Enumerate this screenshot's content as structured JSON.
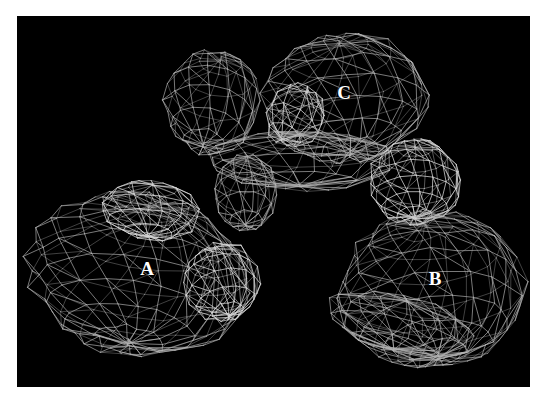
{
  "figure": {
    "panel": {
      "x": 17,
      "y": 16,
      "width": 513,
      "height": 371,
      "background": "#000000"
    },
    "mesh_color": "#b4b4b4",
    "mesh_highlight_color": "#d8d8d8",
    "labels": [
      {
        "id": "A",
        "text": "A",
        "x": 147,
        "y": 268
      },
      {
        "id": "B",
        "text": "B",
        "x": 435,
        "y": 278
      },
      {
        "id": "C",
        "text": "C",
        "x": 344,
        "y": 92
      }
    ],
    "lobes": [
      {
        "name": "lobe-c-left-bulb",
        "cx": 212,
        "cy": 102,
        "rx": 48,
        "ry": 52,
        "rings": 7,
        "segs": 14,
        "tilt": 0.2,
        "highlight": false
      },
      {
        "name": "lobe-c-main",
        "cx": 345,
        "cy": 98,
        "rx": 82,
        "ry": 64,
        "rings": 9,
        "segs": 18,
        "tilt": -0.1,
        "highlight": false
      },
      {
        "name": "lobe-c-inner-hex",
        "cx": 295,
        "cy": 115,
        "rx": 30,
        "ry": 32,
        "rings": 5,
        "segs": 10,
        "tilt": 0.5,
        "highlight": true
      },
      {
        "name": "lobe-c-lower-band",
        "cx": 300,
        "cy": 160,
        "rx": 95,
        "ry": 30,
        "rings": 5,
        "segs": 16,
        "tilt": 0.0,
        "highlight": false
      },
      {
        "name": "lobe-connector-mid",
        "cx": 246,
        "cy": 192,
        "rx": 32,
        "ry": 38,
        "rings": 6,
        "segs": 12,
        "tilt": 0.0,
        "highlight": false
      },
      {
        "name": "lobe-a-main",
        "cx": 138,
        "cy": 275,
        "rx": 110,
        "ry": 80,
        "rings": 10,
        "segs": 20,
        "tilt": 0.15,
        "highlight": false
      },
      {
        "name": "lobe-a-top",
        "cx": 150,
        "cy": 210,
        "rx": 50,
        "ry": 30,
        "rings": 6,
        "segs": 12,
        "tilt": 0.1,
        "highlight": true
      },
      {
        "name": "lobe-a-cap",
        "cx": 222,
        "cy": 282,
        "rx": 38,
        "ry": 40,
        "rings": 7,
        "segs": 14,
        "tilt": -0.2,
        "highlight": true
      },
      {
        "name": "lobe-b-top",
        "cx": 415,
        "cy": 182,
        "rx": 46,
        "ry": 42,
        "rings": 8,
        "segs": 16,
        "tilt": 0.0,
        "highlight": true
      },
      {
        "name": "lobe-b-main",
        "cx": 432,
        "cy": 290,
        "rx": 92,
        "ry": 78,
        "rings": 10,
        "segs": 20,
        "tilt": -0.1,
        "highlight": false
      },
      {
        "name": "lobe-b-bottom-lip",
        "cx": 400,
        "cy": 325,
        "rx": 75,
        "ry": 30,
        "rings": 5,
        "segs": 16,
        "tilt": 0.25,
        "highlight": false
      }
    ]
  }
}
